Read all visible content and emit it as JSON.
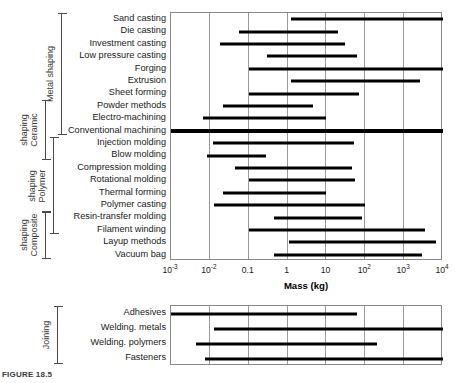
{
  "figure": {
    "caption": "FIGURE 18.5",
    "axis_title": "Mass (kg)"
  },
  "axis": {
    "ticks": [
      {
        "label": "10",
        "exp": "-3",
        "value": 0.001
      },
      {
        "label": "10",
        "exp": "-2",
        "value": 0.01
      },
      {
        "label": "0.1",
        "exp": "",
        "value": 0.1
      },
      {
        "label": "1",
        "exp": "",
        "value": 1
      },
      {
        "label": "10",
        "exp": "",
        "value": 10
      },
      {
        "label": "10",
        "exp": "2",
        "value": 100
      },
      {
        "label": "10",
        "exp": "3",
        "value": 1000
      },
      {
        "label": "10",
        "exp": "4",
        "value": 10000
      }
    ],
    "min": 0.001,
    "max": 10000,
    "scale": "log"
  },
  "groups": [
    {
      "name": "metal-shaping",
      "label": "Metal shaping",
      "rows": [
        0,
        9
      ]
    },
    {
      "name": "ceramic-shaping",
      "label": "Ceramic\nshaping",
      "label_line1": "Ceramic",
      "label_line2": "shaping",
      "rows": [
        7,
        10
      ]
    },
    {
      "name": "polymer-shaping",
      "label_line1": "Polymer",
      "label_line2": "shaping",
      "rows": [
        10,
        17
      ]
    },
    {
      "name": "composite-shaping",
      "label_line1": "Composite",
      "label_line2": "shaping",
      "rows": [
        16,
        19
      ]
    },
    {
      "name": "joining",
      "label_line1": "Joining",
      "label_line2": "",
      "rows": [
        0,
        3
      ]
    }
  ],
  "chart_data": {
    "type": "bar",
    "orientation": "horizontal-range",
    "title": "",
    "xlabel": "Mass (kg)",
    "ylabel": "",
    "xscale": "log",
    "xlim": [
      0.001,
      10000
    ],
    "grid": true,
    "legend": "none",
    "panels": [
      {
        "name": "shaping-processes",
        "categories": [
          "Sand casting",
          "Die casting",
          "Investment casting",
          "Low pressure casting",
          "Forging",
          "Extrusion",
          "Sheet forming",
          "Powder methods",
          "Electro-machining",
          "Conventional machining",
          "Injection molding",
          "Blow molding",
          "Compression molding",
          "Rotational molding",
          "Thermal forming",
          "Polymer casting",
          "Resin-transfer molding",
          "Filament winding",
          "Layup methods",
          "Vacuum bag"
        ],
        "ranges": [
          [
            1.2,
            10000
          ],
          [
            0.055,
            20
          ],
          [
            0.018,
            30
          ],
          [
            0.3,
            60
          ],
          [
            0.1,
            10000
          ],
          [
            1.2,
            2500
          ],
          [
            0.1,
            70
          ],
          [
            0.022,
            4.5
          ],
          [
            0.0065,
            10
          ],
          [
            0.001,
            10000
          ],
          [
            0.012,
            50
          ],
          [
            0.0085,
            0.28
          ],
          [
            0.045,
            45
          ],
          [
            0.1,
            55
          ],
          [
            0.022,
            10
          ],
          [
            0.013,
            100
          ],
          [
            0.45,
            80
          ],
          [
            0.1,
            3500
          ],
          [
            1.1,
            6500
          ],
          [
            0.45,
            2800
          ]
        ]
      },
      {
        "name": "joining-processes",
        "categories": [
          "Adhesives",
          "Welding. metals",
          "Welding. polymers",
          "Fasteners"
        ],
        "ranges": [
          [
            0.001,
            60
          ],
          [
            0.013,
            10000
          ],
          [
            0.0045,
            200
          ],
          [
            0.0075,
            10000
          ]
        ]
      }
    ]
  },
  "colors": {
    "bar": "#000000",
    "grid": "#9a9a9a",
    "frame": "#8a8a8a",
    "text": "#1a1a1a",
    "group_text": "#3a3a3a"
  }
}
